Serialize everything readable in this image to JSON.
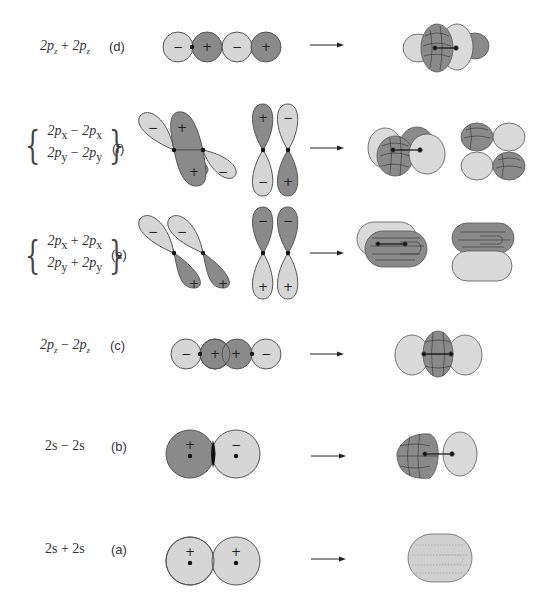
{
  "figure": {
    "colors": {
      "positive_lobe": "#8a8a8a",
      "negative_lobe": "#d6d6d6",
      "outline": "#555555",
      "node": "#111111",
      "arrow": "#222222"
    },
    "rows": [
      {
        "id": "d",
        "tag": "(d)",
        "combination": "2p_z + 2p_z",
        "lines": [
          {
            "a": "2p",
            "sa": "z",
            "op": " + ",
            "b": "2p",
            "sb": "z"
          }
        ],
        "lobe_signs": [
          "−",
          "+",
          "−",
          "+"
        ],
        "result": "sigma antibonding (σ*2p)"
      },
      {
        "id": "f",
        "tag": "(f)",
        "combination": "2p_x − 2p_x / 2p_y − 2p_y",
        "lines": [
          {
            "a": "2p",
            "sa": "x",
            "op": " − ",
            "b": "2p",
            "sb": "x"
          },
          {
            "a": "2p",
            "sa": "y",
            "op": " − ",
            "b": "2p",
            "sb": "y"
          }
        ],
        "tilted_signs": [
          "−",
          "+",
          "+",
          "−"
        ],
        "vertical_signs": [
          "+",
          "−",
          "−",
          "+"
        ],
        "result": "pi antibonding (π*2p)"
      },
      {
        "id": "e",
        "tag": "(e)",
        "combination": "2p_x + 2p_x / 2p_y + 2p_y",
        "lines": [
          {
            "a": "2p",
            "sa": "x",
            "op": " + ",
            "b": "2p",
            "sb": "x"
          },
          {
            "a": "2p",
            "sa": "y",
            "op": " + ",
            "b": "2p",
            "sb": "y"
          }
        ],
        "tilted_signs": [
          "−",
          "−",
          "+",
          "+"
        ],
        "vertical_signs": [
          "−",
          "−",
          "+",
          "+"
        ],
        "result": "pi bonding (π2p)"
      },
      {
        "id": "c",
        "tag": "(c)",
        "combination": "2p_z − 2p_z",
        "lines": [
          {
            "a": "2p",
            "sa": "z",
            "op": " − ",
            "b": "2p",
            "sb": "z"
          }
        ],
        "lobe_signs": [
          "−",
          "+",
          "+",
          "−"
        ],
        "result": "sigma bonding (σ2p)"
      },
      {
        "id": "b",
        "tag": "(b)",
        "combination": "2s − 2s",
        "text": "2s − 2s",
        "lobe_signs": [
          "+",
          "−"
        ],
        "result": "sigma antibonding (σ*2s)"
      },
      {
        "id": "a",
        "tag": "(a)",
        "combination": "2s + 2s",
        "text": "2s + 2s",
        "lobe_signs": [
          "+",
          "+"
        ],
        "result": "sigma bonding (σ2s)"
      }
    ]
  }
}
